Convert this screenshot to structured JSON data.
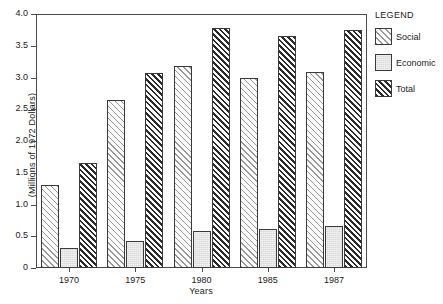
{
  "chart_data": {
    "type": "bar",
    "title": "",
    "xlabel": "Years",
    "ylabel": "(Millions of 1972 Dollars)",
    "categories": [
      "1970",
      "1975",
      "1980",
      "1985",
      "1987"
    ],
    "series": [
      {
        "name": "Social",
        "values": [
          1.31,
          2.65,
          3.18,
          3.0,
          3.08
        ],
        "pattern": "light-diagonal-hatch",
        "color": "#999999"
      },
      {
        "name": "Economic",
        "values": [
          0.32,
          0.43,
          0.58,
          0.61,
          0.66
        ],
        "pattern": "solid-light-gray",
        "color": "#d9d9d9"
      },
      {
        "name": "Total",
        "values": [
          1.66,
          3.07,
          3.78,
          3.65,
          3.75
        ],
        "pattern": "dense-diagonal-hatch",
        "color": "#2b2b2b"
      }
    ],
    "ylim": [
      0,
      4.0
    ],
    "ytick_labels": [
      "4.0",
      "3.5",
      "3.0",
      "2.5",
      "2.0",
      "1.5",
      "1.0",
      "0.5",
      "0"
    ],
    "ytick_values": [
      4.0,
      3.5,
      3.0,
      2.5,
      2.0,
      1.5,
      1.0,
      0.5,
      0
    ],
    "grid": false,
    "legend_position": "right-outside"
  },
  "legend": {
    "title": "LEGEND",
    "entries": [
      {
        "label": "Social"
      },
      {
        "label": "Economic"
      },
      {
        "label": "Total"
      }
    ]
  }
}
